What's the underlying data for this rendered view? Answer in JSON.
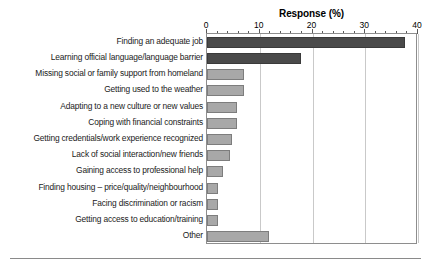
{
  "chart_data": {
    "type": "bar",
    "orientation": "horizontal",
    "title": "Response (%)",
    "xlabel": "Response (%)",
    "ylabel": "",
    "xlim": [
      0,
      40
    ],
    "xticks": [
      0,
      10,
      20,
      30,
      40
    ],
    "xtick_labels": [
      "0",
      "10",
      "20",
      "30",
      "40"
    ],
    "minor_tick_interval": 2,
    "grid": true,
    "grid_axis": "x",
    "legend": "none",
    "categories": [
      "Finding an adequate job",
      "Learning official language/language barrier",
      "Missing social or family support from homeland",
      "Getting used to the weather",
      "Adapting to a new culture or new values",
      "Coping with financial constraints",
      "Getting credentials/work experience recognized",
      "Lack of social interaction/new friends",
      "Gaining access to professional help",
      "Finding housing – price/quality/neighbourhood",
      "Facing discrimination or racism",
      "Getting access to education/training",
      "Other"
    ],
    "values": [
      37.5,
      17.8,
      7.0,
      7.0,
      5.7,
      5.7,
      4.8,
      4.4,
      3.0,
      2.0,
      2.0,
      2.0,
      11.8
    ],
    "bar_colors": [
      "#4a4a4a",
      "#4a4a4a",
      "#a8a8a8",
      "#a8a8a8",
      "#a8a8a8",
      "#a8a8a8",
      "#a8a8a8",
      "#a8a8a8",
      "#a8a8a8",
      "#a8a8a8",
      "#a8a8a8",
      "#a8a8a8",
      "#a8a8a8"
    ]
  },
  "colors": {
    "bar_dark": "#4a4a4a",
    "bar_light": "#a8a8a8",
    "gridline": "#c9c9c9",
    "frame": "#8e8e8e",
    "text": "#1a1a1a",
    "rule": "#8a8a8a"
  }
}
